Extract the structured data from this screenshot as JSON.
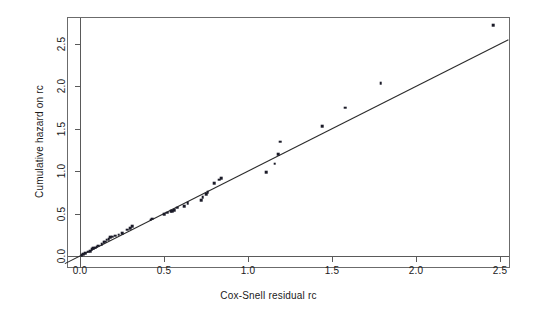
{
  "chart_data": {
    "type": "scatter",
    "title": "",
    "subtitle": "",
    "xlabel": "Cox-Snell residual rc",
    "ylabel": "Cumulative hazard on rc",
    "xlim": [
      -0.09,
      2.56
    ],
    "ylim": [
      -0.08,
      2.83
    ],
    "xticks": [
      "0.0",
      "0.5",
      "1.0",
      "1.5",
      "2.0",
      "2.5"
    ],
    "xtick_values": [
      0.0,
      0.5,
      1.0,
      1.5,
      2.0,
      2.5
    ],
    "yticks": [
      "0.0",
      "0.5",
      "1.0",
      "1.5",
      "2.0",
      "2.5"
    ],
    "ytick_values": [
      0.0,
      0.5,
      1.0,
      1.5,
      2.0,
      2.5
    ],
    "grid": false,
    "legend": null,
    "legend_position": "none",
    "point_color": "#1b1b28",
    "line_color": "#2b2b2b",
    "frame_color": "#6b6b6b",
    "series": [
      {
        "name": "Cumulative hazard vs Cox-Snell residual",
        "marker": "square",
        "points": [
          [
            0.01,
            0.01
          ],
          [
            0.02,
            0.02
          ],
          [
            0.03,
            0.03
          ],
          [
            0.05,
            0.05
          ],
          [
            0.06,
            0.06
          ],
          [
            0.07,
            0.08
          ],
          [
            0.08,
            0.09
          ],
          [
            0.09,
            0.1
          ],
          [
            0.1,
            0.11
          ],
          [
            0.11,
            0.12
          ],
          [
            0.13,
            0.14
          ],
          [
            0.14,
            0.16
          ],
          [
            0.15,
            0.17
          ],
          [
            0.16,
            0.19
          ],
          [
            0.17,
            0.2
          ],
          [
            0.18,
            0.22
          ],
          [
            0.19,
            0.23
          ],
          [
            0.21,
            0.24
          ],
          [
            0.23,
            0.25
          ],
          [
            0.25,
            0.27
          ],
          [
            0.28,
            0.31
          ],
          [
            0.3,
            0.33
          ],
          [
            0.31,
            0.35
          ],
          [
            0.42,
            0.43
          ],
          [
            0.43,
            0.44
          ],
          [
            0.5,
            0.49
          ],
          [
            0.52,
            0.51
          ],
          [
            0.54,
            0.53
          ],
          [
            0.55,
            0.53
          ],
          [
            0.56,
            0.54
          ],
          [
            0.58,
            0.57
          ],
          [
            0.62,
            0.59
          ],
          [
            0.64,
            0.62
          ],
          [
            0.72,
            0.66
          ],
          [
            0.73,
            0.69
          ],
          [
            0.75,
            0.73
          ],
          [
            0.76,
            0.75
          ],
          [
            0.8,
            0.86
          ],
          [
            0.83,
            0.9
          ],
          [
            0.84,
            0.92
          ],
          [
            1.11,
            0.99
          ],
          [
            1.16,
            1.09
          ],
          [
            1.18,
            1.2
          ],
          [
            1.19,
            1.35
          ],
          [
            1.44,
            1.53
          ],
          [
            1.58,
            1.75
          ],
          [
            1.79,
            2.04
          ],
          [
            2.46,
            2.72
          ]
        ]
      }
    ],
    "reference_line": {
      "name": "45-degree reference line",
      "type": "straight",
      "slope": 1.0,
      "intercept": 0.0,
      "x_start": -0.09,
      "x_end": 2.55,
      "y_start": -0.09,
      "y_end": 2.55
    }
  }
}
